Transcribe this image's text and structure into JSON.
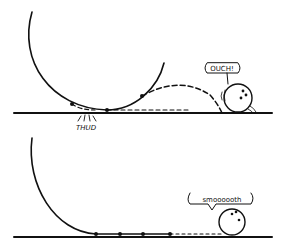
{
  "figure": {
    "panels": [
      {
        "id": "top",
        "impact_label": "THUD",
        "speech": "OUCH!",
        "outcome": "bouncing"
      },
      {
        "id": "bottom",
        "speech": "smoooooth",
        "outcome": "smooth-roll"
      }
    ]
  },
  "colors": {
    "ink": "#111111",
    "background": "#ffffff"
  }
}
